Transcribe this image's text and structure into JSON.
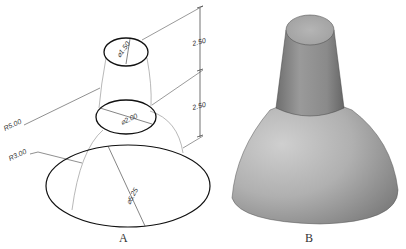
{
  "figure_a": {
    "caption": "A",
    "dimensions": {
      "top_diameter": "⌀1.50",
      "middle_diameter": "⌀2.00",
      "base_diameter": "⌀5.25",
      "outer_radius": "R5.00",
      "inner_radius": "R3.00",
      "upper_height": "2.50",
      "lower_height": "2.50"
    }
  },
  "figure_b": {
    "caption": "B"
  },
  "colors": {
    "line": "#1a1a1a",
    "thin_line": "#777777",
    "shade_light": "#c9c9c9",
    "shade_dark": "#7d7d7d"
  }
}
